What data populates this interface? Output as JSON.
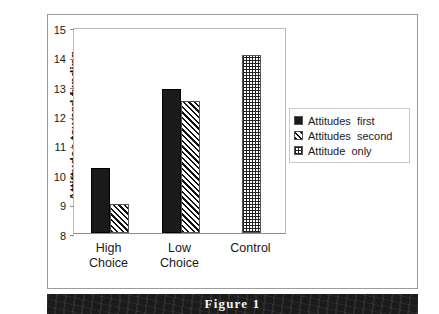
{
  "figure": {
    "caption": "Figure 1"
  },
  "chart_data": {
    "type": "bar",
    "title": "",
    "xlabel": "",
    "ylabel": "Attittudes toward funding",
    "ylim": [
      8,
      15
    ],
    "yticks": [
      8,
      9,
      10,
      11,
      12,
      13,
      14,
      15
    ],
    "ytick_labels": [
      "8",
      "9",
      "10",
      "11",
      "12",
      "13",
      "14",
      "15"
    ],
    "grid": false,
    "legend_position": "right",
    "categories": [
      "High\nChoice",
      "Low\nChoice",
      "Control"
    ],
    "category_labels": [
      "High\nChoice",
      "Low\nChoice",
      "Control"
    ],
    "series": [
      {
        "name": "Attitudes  first",
        "pattern": "solid",
        "color": "#1a1a1a",
        "values": [
          10.2,
          12.9,
          null
        ]
      },
      {
        "name": "Attitudes  second",
        "pattern": "diagonal",
        "color": "#111111",
        "values": [
          9.0,
          12.5,
          null
        ]
      },
      {
        "name": "Attitude  only",
        "pattern": "checker",
        "color": "#222222",
        "values": [
          null,
          null,
          14.05
        ]
      }
    ]
  },
  "legend": {
    "items": [
      {
        "label": "Attitudes  first"
      },
      {
        "label": "Attitudes  second"
      },
      {
        "label": "Attitude  only"
      }
    ]
  },
  "axis": {
    "y_title": "Attittudes toward funding"
  }
}
